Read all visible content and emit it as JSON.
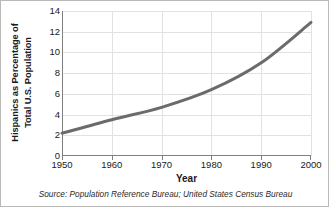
{
  "chart_data": {
    "type": "line",
    "title": "",
    "xlabel": "Year",
    "ylabel_line1": "Hispanics as Percentage of",
    "ylabel_line2": "Total U.S. Population",
    "ylabel": "Hispanics as Percentage of Total U.S. Population",
    "x": [
      1950,
      1960,
      1970,
      1980,
      1990,
      2000
    ],
    "values": [
      2.2,
      3.5,
      4.7,
      6.4,
      9.0,
      12.9
    ],
    "xticklabels": [
      "1950",
      "1960",
      "1970",
      "1980",
      "1990",
      "2000"
    ],
    "yticks": [
      0,
      2,
      4,
      6,
      8,
      10,
      12,
      14
    ],
    "yticklabels": [
      "0",
      "2",
      "4",
      "6",
      "8",
      "10",
      "12",
      "14"
    ],
    "xlim": [
      1950,
      2000
    ],
    "ylim": [
      0,
      14
    ],
    "grid": true,
    "legend": "none",
    "series_color": "#6b6b6b",
    "grid_color": "#e2e2e2",
    "axis_color": "#808080",
    "text_color": "#1a1a1a"
  },
  "source_note": "Source: Population Reference Bureau; United States Census Bureau"
}
